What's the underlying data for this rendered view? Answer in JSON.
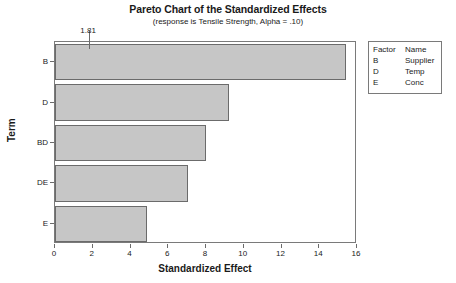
{
  "chart_data": {
    "type": "bar",
    "orientation": "horizontal",
    "title": "Pareto Chart of the Standardized Effects",
    "subtitle": "(response is Tensile Strength, Alpha = .10)",
    "xlabel": "Standardized Effect",
    "ylabel": "Term",
    "categories": [
      "B",
      "D",
      "BD",
      "DE",
      "E"
    ],
    "values": [
      15.4,
      9.2,
      8.0,
      7.05,
      4.9
    ],
    "xlim": [
      0,
      16.0
    ],
    "xticks": [
      0,
      2,
      4,
      6,
      8,
      10,
      12,
      14,
      16
    ],
    "xtick_labels": [
      "0",
      "2",
      "4",
      "6",
      "8",
      "10",
      "12",
      "14",
      "16"
    ],
    "grid": false,
    "reference_line": {
      "value": 1.81,
      "label": "1.81"
    },
    "legend": {
      "position": "right",
      "headers": [
        "Factor",
        "Name"
      ],
      "rows": [
        {
          "factor": "B",
          "name": "Supplier"
        },
        {
          "factor": "D",
          "name": "Temp"
        },
        {
          "factor": "E",
          "name": "Conc"
        }
      ]
    },
    "colors": {
      "bar_fill": "#c6c6c6",
      "bar_border": "#6b6b6b",
      "frame": "#7a7a7a",
      "text": "#1a1a1a",
      "background": "#ffffff"
    }
  }
}
